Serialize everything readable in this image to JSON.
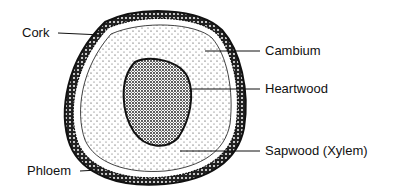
{
  "diagram": {
    "labels": {
      "cork": "Cork",
      "cambium": "Cambium",
      "heartwood": "Heartwood",
      "sapwood": "Sapwood (Xylem)",
      "phloem": "Phloem"
    },
    "colors": {
      "ink": "#111111",
      "background": "#ffffff"
    }
  }
}
